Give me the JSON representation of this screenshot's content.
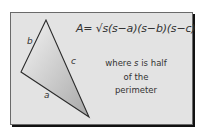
{
  "diagram": {
    "formula": "A= √s(s−a)(s−b)(s−c)",
    "note": {
      "line1_pre": "where ",
      "line1_var": "s",
      "line1_post": " is half",
      "line2": "of the",
      "line3": "perimeter"
    },
    "triangle": {
      "vertices": [
        [
          46,
          20
        ],
        [
          21,
          72
        ],
        [
          89,
          117
        ]
      ],
      "labels": {
        "a": "a",
        "b": "b",
        "c": "c"
      }
    },
    "colors": {
      "card": "#e3e3e3",
      "shadow": "#111111",
      "stroke": "#2a2a2a",
      "text": "#333333"
    }
  }
}
